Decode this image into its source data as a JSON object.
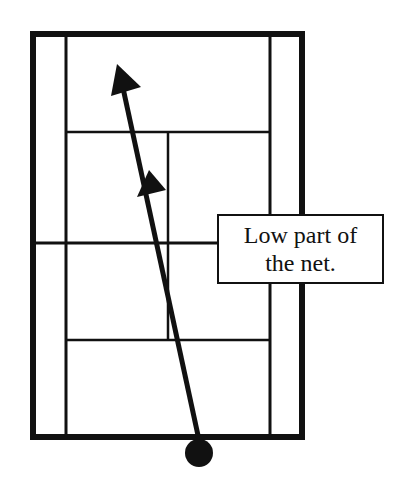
{
  "diagram": {
    "type": "tennis-court-shot-path",
    "label": {
      "line1": "Low part of",
      "line2": "the net."
    },
    "court": {
      "outer": {
        "x": 33,
        "y": 34,
        "w": 269,
        "h": 403
      },
      "singles_left_x": 66,
      "singles_right_x": 270,
      "service_line_top_y": 132,
      "service_line_bottom_y": 340,
      "center_service_x": 168,
      "net_y": 243
    },
    "shot": {
      "start": {
        "x": 199,
        "y": 437
      },
      "end": {
        "x": 117,
        "y": 65
      }
    },
    "ball": {
      "cx": 199,
      "cy": 453,
      "r": 14
    },
    "colors": {
      "line": "#111111",
      "background": "#ffffff"
    }
  }
}
